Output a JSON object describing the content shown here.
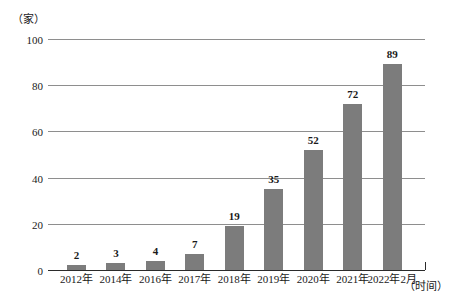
{
  "chart_data": {
    "type": "bar",
    "title": "",
    "xlabel": "（时间）",
    "ylabel": "（家）",
    "categories": [
      "2012年",
      "2014年",
      "2016年",
      "2017年",
      "2018年",
      "2019年",
      "2020年",
      "2021年",
      "2022年2月"
    ],
    "values": [
      2,
      3,
      4,
      7,
      19,
      35,
      52,
      72,
      89
    ],
    "value_labels": [
      "2",
      "3",
      "4",
      "7",
      "19",
      "35",
      "52",
      "72",
      "89"
    ],
    "ylim": [
      0,
      100
    ],
    "yticks": [
      0,
      20,
      40,
      60,
      80,
      100
    ],
    "ytick_labels": [
      "0",
      "20",
      "40",
      "60",
      "80",
      "100"
    ],
    "grid": true,
    "legend": "none",
    "series_color": "#7c7c7c",
    "axis_color": "#2b2b2b",
    "grid_color": "#8e8e8e",
    "background": "#ffffff"
  }
}
